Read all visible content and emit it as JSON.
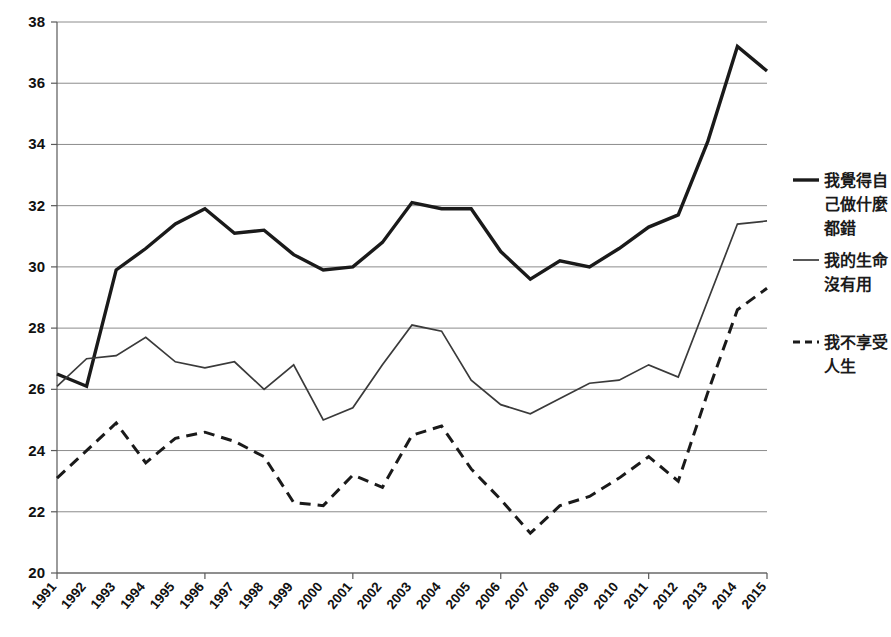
{
  "chart_data": {
    "type": "line",
    "title": "",
    "subtitle": "",
    "xlabel": "",
    "ylabel": "",
    "categories": [
      "1991",
      "1992",
      "1993",
      "1994",
      "1995",
      "1996",
      "1997",
      "1998",
      "1999",
      "2000",
      "2001",
      "2002",
      "2003",
      "2004",
      "2005",
      "2006",
      "2007",
      "2008",
      "2009",
      "2010",
      "2011",
      "2012",
      "2013",
      "2014",
      "2015"
    ],
    "xtick_labels": [
      "1991",
      "1992",
      "1993",
      "1994",
      "1995",
      "1996",
      "1997",
      "1998",
      "1999",
      "2000",
      "2001",
      "2002",
      "2003",
      "2004",
      "2005",
      "2006",
      "2007",
      "2008",
      "2009",
      "2010",
      "2011",
      "2012",
      "2013",
      "2014",
      "2015"
    ],
    "ytick_labels": [
      "20",
      "22",
      "24",
      "26",
      "28",
      "30",
      "32",
      "34",
      "36",
      "38"
    ],
    "yticks": [
      20,
      22,
      24,
      26,
      28,
      30,
      32,
      34,
      36,
      38
    ],
    "ylim": [
      20,
      38
    ],
    "grid": "horizontal",
    "legend_position": "right",
    "series": [
      {
        "name": "我覺得自己做什麼都錯",
        "legend_label": "我覺得自\n己做什麼\n都錯",
        "style": "solid-thick",
        "color": "#1a1a1a",
        "width": 3.4,
        "values": [
          26.5,
          26.1,
          29.9,
          30.6,
          31.4,
          31.9,
          31.1,
          31.2,
          30.4,
          29.9,
          30.0,
          30.8,
          32.1,
          31.9,
          31.9,
          30.5,
          29.6,
          30.2,
          30.0,
          30.6,
          31.3,
          31.7,
          34.1,
          37.2,
          36.4
        ]
      },
      {
        "name": "我的生命沒有用",
        "legend_label": "我的生命\n沒有用",
        "style": "solid-thin",
        "color": "#3a3a3a",
        "width": 1.7,
        "values": [
          26.1,
          27.0,
          27.1,
          27.7,
          26.9,
          26.7,
          26.9,
          26.0,
          26.8,
          25.0,
          25.4,
          26.8,
          28.1,
          27.9,
          26.3,
          25.5,
          25.2,
          25.7,
          26.2,
          26.3,
          26.8,
          26.4,
          28.9,
          31.4,
          31.5
        ]
      },
      {
        "name": "我不享受人生",
        "legend_label": "我不享受\n人生",
        "style": "dashed",
        "color": "#1a1a1a",
        "width": 3.0,
        "values": [
          23.1,
          24.0,
          24.9,
          23.6,
          24.4,
          24.6,
          24.3,
          23.8,
          22.3,
          22.2,
          23.2,
          22.8,
          24.5,
          24.8,
          23.4,
          22.4,
          21.3,
          22.2,
          22.5,
          23.1,
          23.8,
          23.0,
          25.9,
          28.6,
          29.3
        ]
      }
    ],
    "legend_entries": [
      {
        "label_lines": [
          "我覺得自",
          "己做什麼",
          "都錯"
        ],
        "style": "solid-thick"
      },
      {
        "label_lines": [
          "我的生命",
          "沒有用"
        ],
        "style": "solid-thin"
      },
      {
        "label_lines": [
          "我不享受",
          "人生"
        ],
        "style": "dashed"
      }
    ]
  },
  "colors": {
    "background": "#ffffff",
    "grid": "#8c8c8c",
    "axis": "#595959",
    "text": "#111111",
    "series_thick": "#1a1a1a",
    "series_thin": "#3a3a3a",
    "series_dashed": "#1a1a1a"
  }
}
